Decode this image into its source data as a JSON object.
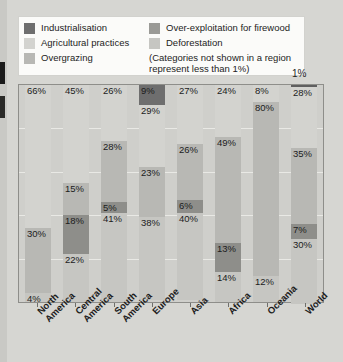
{
  "legend": {
    "items": [
      {
        "label": "Industrialisation",
        "color": "#6e6e6e",
        "column": "left"
      },
      {
        "label": "Agricultural practices",
        "color": "#d3d3cf",
        "column": "left"
      },
      {
        "label": "Overgrazing",
        "color": "#b8b8b4",
        "column": "left"
      },
      {
        "label": "Over-exploitation for firewood",
        "color": "#9a9a96",
        "column": "right"
      },
      {
        "label": "Deforestation",
        "color": "#c6c6c2",
        "column": "right"
      }
    ],
    "note": "(Categories not shown in a region represent less than 1%)"
  },
  "callout": {
    "world_top_label": "1%"
  },
  "chart_data": {
    "type": "bar",
    "subtype": "stacked-percentage",
    "title": "",
    "xlabel": "",
    "ylabel": "",
    "ylim": [
      0,
      100
    ],
    "grid": true,
    "legend_position": "top",
    "categories": [
      "North America",
      "Central America",
      "South America",
      "Europe",
      "Asia",
      "Africa",
      "Oceania",
      "World"
    ],
    "series": [
      {
        "name": "Industrialisation",
        "color": "#6e6e6e",
        "values": [
          0,
          0,
          0,
          9,
          0,
          0,
          0,
          1
        ]
      },
      {
        "name": "Agricultural practices",
        "color": "#d3d3cf",
        "values": [
          66,
          45,
          26,
          29,
          27,
          24,
          8,
          28
        ]
      },
      {
        "name": "Overgrazing",
        "color": "#b8b8b4",
        "values": [
          30,
          15,
          28,
          23,
          26,
          49,
          80,
          35
        ]
      },
      {
        "name": "Over-exploitation for firewood",
        "color": "#9a9a96",
        "values": [
          0,
          18,
          5,
          0,
          6,
          13,
          0,
          7
        ]
      },
      {
        "name": "Deforestation",
        "color": "#c6c6c2",
        "values": [
          4,
          22,
          41,
          38,
          40,
          14,
          12,
          30
        ]
      }
    ],
    "bars": [
      {
        "category": "North America",
        "label_line1": "North",
        "label_line2": "America",
        "segments": [
          {
            "series": "Agricultural practices",
            "value": 66,
            "label": "66%",
            "color": "#d3d3cf"
          },
          {
            "series": "Overgrazing",
            "value": 30,
            "label": "30%",
            "color": "#b8b8b4"
          },
          {
            "series": "Deforestation",
            "value": 4,
            "label": "4%",
            "color": "#c6c6c2"
          }
        ]
      },
      {
        "category": "Central America",
        "label_line1": "Central",
        "label_line2": "America",
        "segments": [
          {
            "series": "Agricultural practices",
            "value": 45,
            "label": "45%",
            "color": "#d3d3cf"
          },
          {
            "series": "Overgrazing",
            "value": 15,
            "label": "15%",
            "color": "#b8b8b4"
          },
          {
            "series": "Over-exploitation for firewood",
            "value": 18,
            "label": "18%",
            "color": "#8e8e8a"
          },
          {
            "series": "Deforestation",
            "value": 22,
            "label": "22%",
            "color": "#c6c6c2"
          }
        ]
      },
      {
        "category": "South America",
        "label_line1": "South",
        "label_line2": "America",
        "segments": [
          {
            "series": "Agricultural practices",
            "value": 26,
            "label": "26%",
            "color": "#d3d3cf"
          },
          {
            "series": "Overgrazing",
            "value": 28,
            "label": "28%",
            "color": "#b8b8b4"
          },
          {
            "series": "Over-exploitation for firewood",
            "value": 5,
            "label": "5%",
            "color": "#8e8e8a"
          },
          {
            "series": "Deforestation",
            "value": 41,
            "label": "41%",
            "color": "#c6c6c2"
          }
        ]
      },
      {
        "category": "Europe",
        "label_line1": "Europe",
        "label_line2": "",
        "segments": [
          {
            "series": "Industrialisation",
            "value": 9,
            "label": "9%",
            "color": "#6e6e6e"
          },
          {
            "series": "Agricultural practices",
            "value": 29,
            "label": "29%",
            "color": "#d3d3cf"
          },
          {
            "series": "Overgrazing",
            "value": 23,
            "label": "23%",
            "color": "#b8b8b4"
          },
          {
            "series": "Deforestation",
            "value": 38,
            "label": "38%",
            "color": "#c6c6c2"
          }
        ]
      },
      {
        "category": "Asia",
        "label_line1": "Asia",
        "label_line2": "",
        "segments": [
          {
            "series": "Agricultural practices",
            "value": 27,
            "label": "27%",
            "color": "#d3d3cf"
          },
          {
            "series": "Overgrazing",
            "value": 26,
            "label": "26%",
            "color": "#b8b8b4"
          },
          {
            "series": "Over-exploitation for firewood",
            "value": 6,
            "label": "6%",
            "color": "#8e8e8a"
          },
          {
            "series": "Deforestation",
            "value": 40,
            "label": "40%",
            "color": "#c6c6c2"
          }
        ]
      },
      {
        "category": "Africa",
        "label_line1": "Africa",
        "label_line2": "",
        "segments": [
          {
            "series": "Agricultural practices",
            "value": 24,
            "label": "24%",
            "color": "#d3d3cf"
          },
          {
            "series": "Overgrazing",
            "value": 49,
            "label": "49%",
            "color": "#b8b8b4"
          },
          {
            "series": "Over-exploitation for firewood",
            "value": 13,
            "label": "13%",
            "color": "#8e8e8a"
          },
          {
            "series": "Deforestation",
            "value": 14,
            "label": "14%",
            "color": "#c6c6c2"
          }
        ]
      },
      {
        "category": "Oceania",
        "label_line1": "Oceania",
        "label_line2": "",
        "segments": [
          {
            "series": "Agricultural practices",
            "value": 8,
            "label": "8%",
            "color": "#d3d3cf"
          },
          {
            "series": "Overgrazing",
            "value": 80,
            "label": "80%",
            "color": "#b8b8b4"
          },
          {
            "series": "Deforestation",
            "value": 12,
            "label": "12%",
            "color": "#c6c6c2"
          }
        ]
      },
      {
        "category": "World",
        "label_line1": "World",
        "label_line2": "",
        "segments": [
          {
            "series": "Industrialisation",
            "value": 1,
            "label": "",
            "color": "#5f5f5f"
          },
          {
            "series": "Agricultural practices",
            "value": 28,
            "label": "28%",
            "color": "#d3d3cf"
          },
          {
            "series": "Overgrazing",
            "value": 35,
            "label": "35%",
            "color": "#b8b8b4"
          },
          {
            "series": "Over-exploitation for firewood",
            "value": 7,
            "label": "7%",
            "color": "#8e8e8a"
          },
          {
            "series": "Deforestation",
            "value": 30,
            "label": "30%",
            "color": "#c6c6c2"
          }
        ]
      }
    ]
  }
}
